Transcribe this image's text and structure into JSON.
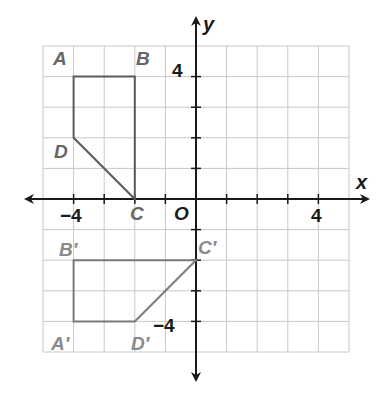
{
  "diagram": {
    "type": "coordinate-plane-transformation",
    "axes": {
      "x_label": "x",
      "y_label": "y",
      "origin_label": "O",
      "x_range": [
        -5,
        5
      ],
      "y_range": [
        -5,
        5
      ],
      "x_tick_labels": [
        {
          "value": -4,
          "text": "−4"
        },
        {
          "value": 4,
          "text": "4"
        }
      ],
      "y_tick_labels": [
        {
          "value": 4,
          "text": "4"
        },
        {
          "value": -4,
          "text": "−4"
        }
      ]
    },
    "figures": [
      {
        "name": "ABCD",
        "vertices": [
          {
            "label": "A",
            "x": -4,
            "y": 4
          },
          {
            "label": "B",
            "x": -2,
            "y": 4
          },
          {
            "label": "C",
            "x": -2,
            "y": 0
          },
          {
            "label": "D",
            "x": -4,
            "y": 2
          }
        ]
      },
      {
        "name": "A'B'C'D'",
        "vertices": [
          {
            "label": "A′",
            "x": -4,
            "y": -4
          },
          {
            "label": "B′",
            "x": -4,
            "y": -2
          },
          {
            "label": "C′",
            "x": 0,
            "y": -2
          },
          {
            "label": "D′",
            "x": -2,
            "y": -4
          }
        ]
      }
    ],
    "colors": {
      "grid": "#c8c8c8",
      "axis": "#1a1a1a",
      "figure": "#5a5a5a",
      "figure_prime": "#7a7a7a",
      "label": "#666666",
      "label_prime": "#8a8a8a"
    }
  }
}
